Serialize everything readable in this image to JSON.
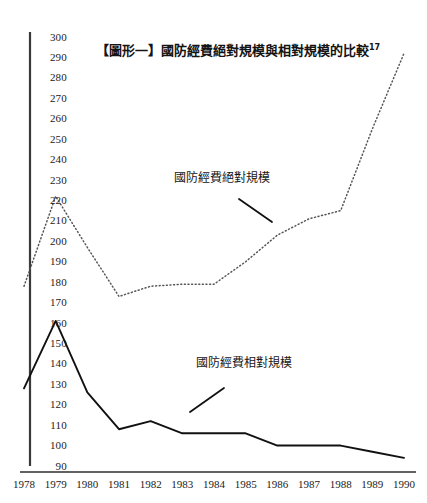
{
  "figure": {
    "title_text": "【圖形一】國防經費絕對規模與相對規模的比較",
    "title_footnote": "17"
  },
  "annotations": {
    "absolute_label": "國防經費絕對規模",
    "relative_label": "國防經費相對規模"
  },
  "axis": {
    "y_ticks": [
      "300",
      "290",
      "280",
      "270",
      "260",
      "250",
      "240",
      "230",
      "220",
      "210",
      "200",
      "190",
      "180",
      "170",
      "160",
      "150",
      "140",
      "130",
      "120",
      "110",
      "100",
      "90"
    ],
    "x_ticks": [
      "1978",
      "1979",
      "1980",
      "1981",
      "1982",
      "1983",
      "1984",
      "1985",
      "1986",
      "1987",
      "1988",
      "1989",
      "1990"
    ]
  },
  "colors": {
    "ink": "#1a1a1a",
    "axis": "#3a3a3a",
    "solid_series": "#111111",
    "dotted_series": "#555555"
  },
  "chart_data": {
    "type": "line",
    "title": "【圖形一】國防經費絕對規模與相對規模的比較",
    "xlabel": "",
    "ylabel": "",
    "x": [
      "1978",
      "1979",
      "1980",
      "1981",
      "1982",
      "1983",
      "1984",
      "1985",
      "1986",
      "1987",
      "1988",
      "1989",
      "1990"
    ],
    "ylim": [
      90,
      300
    ],
    "ytick_step": 10,
    "grid": false,
    "legend_position": "inline-annotation",
    "series": [
      {
        "name": "國防經費絕對規模",
        "style": "dotted",
        "values": [
          178,
          222,
          197,
          173,
          178,
          179,
          179,
          190,
          203,
          211,
          215,
          255,
          292
        ]
      },
      {
        "name": "國防經費相對規模",
        "style": "solid",
        "values": [
          128,
          161,
          126,
          108,
          112,
          106,
          106,
          106,
          100,
          100,
          100,
          97,
          94
        ]
      }
    ]
  }
}
